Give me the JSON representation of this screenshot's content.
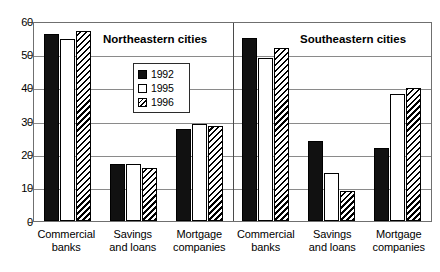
{
  "chart_data": {
    "type": "bar",
    "title": "",
    "xlabel": "",
    "ylabel": "",
    "ylim": [
      0,
      60
    ],
    "yticks": [
      0,
      10,
      20,
      30,
      40,
      50,
      60
    ],
    "grid": true,
    "legend_position": "inside-upper-left-of-right-of-first-group",
    "legend": [
      "1992",
      "1995",
      "1996"
    ],
    "panels": [
      {
        "title": "Northeastern cities",
        "categories": [
          "Commercial banks",
          "Savings and loans",
          "Mortgage companies"
        ],
        "series": [
          {
            "name": "1992",
            "values": [
              56,
              17,
              27.5
            ]
          },
          {
            "name": "1995",
            "values": [
              54.5,
              17,
              29
            ]
          },
          {
            "name": "1996",
            "values": [
              57,
              16,
              28.5
            ]
          }
        ]
      },
      {
        "title": "Southeastern cities",
        "categories": [
          "Commercial banks",
          "Savings and loans",
          "Mortgage companies"
        ],
        "series": [
          {
            "name": "1992",
            "values": [
              55,
              24,
              22
            ]
          },
          {
            "name": "1995",
            "values": [
              49,
              14.5,
              38
            ]
          },
          {
            "name": "1996",
            "values": [
              52,
              9,
              40
            ]
          }
        ]
      }
    ],
    "category_lines": [
      [
        "Commercial",
        "banks"
      ],
      [
        "Savings",
        "and loans"
      ],
      [
        "Mortgage",
        "companies"
      ]
    ],
    "colors": {
      "y1992": "#111111",
      "y1995": "#ffffff",
      "y1996_hatch": "#000000",
      "axis": "#4a4a4a",
      "grid": "#8a8a8a",
      "background": "#ffffff"
    }
  }
}
